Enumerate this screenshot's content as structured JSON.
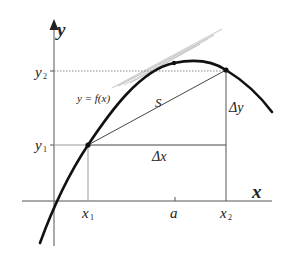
{
  "diagram": {
    "type": "mean-value-theorem-illustration",
    "axes": {
      "x_label": "x",
      "y_label": "y"
    },
    "function_label": "y = f(x)",
    "secant_label": "S",
    "delta_x_label": "Δx",
    "delta_y_label": "Δy",
    "x_ticks": [
      {
        "label": "x",
        "sub": "1"
      },
      {
        "label": "a",
        "sub": ""
      },
      {
        "label": "x",
        "sub": "2"
      }
    ],
    "y_ticks": [
      {
        "label": "y",
        "sub": "1"
      },
      {
        "label": "y",
        "sub": "2"
      }
    ],
    "colors": {
      "curve": "#111111",
      "axes": "#555555",
      "guides": "#777777",
      "tangent": "#cccccc",
      "text": "#222222"
    }
  }
}
